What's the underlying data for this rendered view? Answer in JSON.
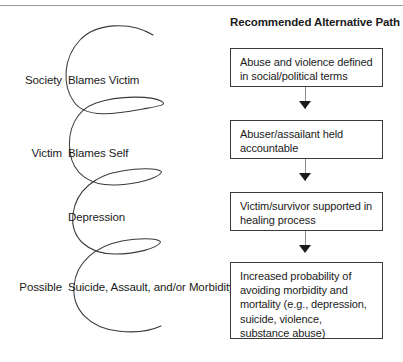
{
  "figure": {
    "title_rule": "horizontal-rule",
    "left_column": {
      "name": "downward-spiral",
      "stages": [
        {
          "actor": "Society",
          "outcome": "Blames Victim"
        },
        {
          "actor": "Victim",
          "outcome": "Blames Self"
        },
        {
          "actor": "",
          "outcome": "Depression"
        },
        {
          "actor": "Possible",
          "outcome": "Suicide, Assault, and/or Morbidity"
        }
      ]
    },
    "right_column": {
      "heading": "Recommended Alternative Path",
      "boxes": [
        {
          "text": "Abuse and violence defined in social/political terms"
        },
        {
          "text": "Abuser/assailant held accountable"
        },
        {
          "text": "Victim/survivor supported in healing process"
        },
        {
          "text": "Increased probability of avoiding morbidity and mortality (e.g., depression, suicide, violence, substance abuse)"
        }
      ],
      "connectors": [
        {
          "name": "down-arrow"
        },
        {
          "name": "down-arrow"
        },
        {
          "name": "down-arrow"
        }
      ]
    },
    "colors": {
      "line": "#3a3a3a",
      "rule": "#9a9a9a",
      "text": "#1b1b1b",
      "connector": "#8d8d8d",
      "background": "#ffffff"
    }
  }
}
